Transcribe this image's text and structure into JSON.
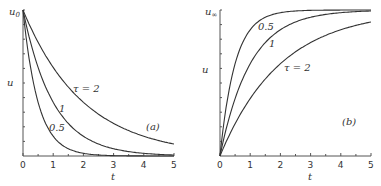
{
  "chart_data": [
    {
      "type": "line",
      "panel": "(a)",
      "xlabel": "t",
      "ylabel": "u",
      "y_top_label": "u0",
      "xlim": [
        0,
        5
      ],
      "x_ticks": [
        "0",
        "1",
        "2",
        "3",
        "4",
        "5"
      ],
      "description": "Exponential decay u = u0·exp(-t/τ)",
      "series": [
        {
          "name": "τ = 2",
          "tau": 2,
          "x": [
            0,
            1,
            2,
            3,
            4,
            5
          ],
          "y": [
            1.0,
            0.607,
            0.368,
            0.223,
            0.135,
            0.082
          ]
        },
        {
          "name": "1",
          "tau": 1,
          "x": [
            0,
            1,
            2,
            3,
            4,
            5
          ],
          "y": [
            1.0,
            0.368,
            0.135,
            0.05,
            0.018,
            0.007
          ]
        },
        {
          "name": "0.5",
          "tau": 0.5,
          "x": [
            0,
            1,
            2,
            3,
            4,
            5
          ],
          "y": [
            1.0,
            0.135,
            0.018,
            0.002,
            0.0,
            0.0
          ]
        }
      ]
    },
    {
      "type": "line",
      "panel": "(b)",
      "xlabel": "t",
      "ylabel": "u",
      "y_top_label": "u∞",
      "xlim": [
        0,
        5
      ],
      "x_ticks": [
        "0",
        "1",
        "2",
        "3",
        "4",
        "5"
      ],
      "description": "Exponential rise u = u∞·(1 - exp(-t/τ))",
      "series": [
        {
          "name": "0.5",
          "tau": 0.5,
          "x": [
            0,
            1,
            2,
            3,
            4,
            5
          ],
          "y": [
            0.0,
            0.865,
            0.982,
            0.998,
            1.0,
            1.0
          ]
        },
        {
          "name": "1",
          "tau": 1,
          "x": [
            0,
            1,
            2,
            3,
            4,
            5
          ],
          "y": [
            0.0,
            0.632,
            0.865,
            0.95,
            0.982,
            0.993
          ]
        },
        {
          "name": "τ = 2",
          "tau": 2,
          "x": [
            0,
            1,
            2,
            3,
            4,
            5
          ],
          "y": [
            0.0,
            0.393,
            0.632,
            0.777,
            0.865,
            0.918
          ]
        }
      ]
    }
  ],
  "labels": {
    "a": {
      "panel": "(a)",
      "ylabel": "u",
      "ytop": "u",
      "ytop_sub": "0",
      "xlabel": "t",
      "curve_tau2": "τ = 2",
      "curve_1": "1",
      "curve_05": "0.5",
      "ticks": [
        "0",
        "1",
        "2",
        "3",
        "4",
        "5"
      ]
    },
    "b": {
      "panel": "(b)",
      "ylabel": "u",
      "ytop": "u",
      "ytop_sub": "∞",
      "xlabel": "t",
      "curve_tau2": "τ = 2",
      "curve_1": "1",
      "curve_05": "0.5",
      "ticks": [
        "0",
        "1",
        "2",
        "3",
        "4",
        "5"
      ]
    }
  }
}
